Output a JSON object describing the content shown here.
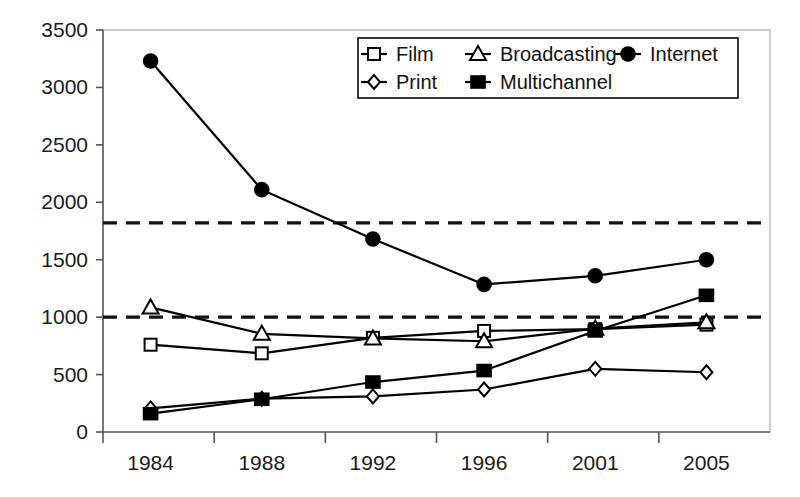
{
  "chart_data": {
    "type": "line",
    "title": "",
    "subtitle": "",
    "xlabel": "",
    "ylabel": "",
    "categories": [
      "1984",
      "1988",
      "1992",
      "1996",
      "2001",
      "2005"
    ],
    "ylim": [
      0,
      3500
    ],
    "yticks": [
      0,
      500,
      1000,
      1500,
      2000,
      2500,
      3000,
      3500
    ],
    "ytick_labels": [
      "0",
      "500",
      "1000",
      "1500",
      "2000",
      "2500",
      "3000",
      "3500"
    ],
    "grid": false,
    "legend_position": "top-right",
    "series": [
      {
        "name": "Film",
        "marker": "open-square",
        "values": [
          760,
          685,
          820,
          880,
          895,
          935
        ]
      },
      {
        "name": "Broadcasting",
        "marker": "open-triangle",
        "values": [
          1085,
          855,
          815,
          790,
          900,
          955
        ]
      },
      {
        "name": "Internet",
        "marker": "filled-circle",
        "values": [
          3230,
          2110,
          1680,
          1285,
          1360,
          1500
        ]
      },
      {
        "name": "Print",
        "marker": "open-diamond",
        "values": [
          205,
          290,
          310,
          370,
          550,
          520
        ]
      },
      {
        "name": "Multichannel",
        "marker": "filled-square",
        "values": [
          160,
          285,
          435,
          535,
          880,
          1190
        ]
      }
    ],
    "reference_lines": [
      {
        "name": "upper-threshold",
        "value": 1820,
        "style": "dashed"
      },
      {
        "name": "lower-threshold",
        "value": 1000,
        "style": "dashed"
      }
    ]
  },
  "legend": {
    "entries": [
      {
        "label": "Film",
        "marker": "open-square"
      },
      {
        "label": "Broadcasting",
        "marker": "open-triangle"
      },
      {
        "label": "Internet",
        "marker": "filled-circle"
      },
      {
        "label": "Print",
        "marker": "open-diamond"
      },
      {
        "label": "Multichannel",
        "marker": "filled-square"
      }
    ]
  },
  "colors": {
    "ink": "#000000",
    "axis": "#555555",
    "frame": "#b8b8b8",
    "background": "#ffffff"
  }
}
